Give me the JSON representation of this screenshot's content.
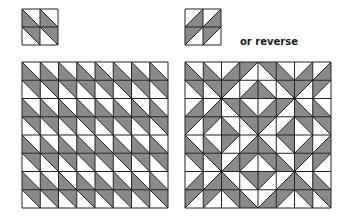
{
  "colors": {
    "gray": "#8a8a8a",
    "white": "#ffffff",
    "line": "#222222"
  },
  "caption": "or reverse",
  "blocks": [
    {
      "name": "block-a",
      "x": 21,
      "y": 8,
      "size": 36,
      "cells": [
        [
          "LL",
          "LL"
        ],
        [
          "UR",
          "UR"
        ]
      ]
    },
    {
      "name": "block-b",
      "x": 184,
      "y": 8,
      "size": 36,
      "cells": [
        [
          "LR",
          "LR"
        ],
        [
          "UL",
          "UL"
        ]
      ]
    }
  ],
  "grids": [
    {
      "name": "quilt-grid-repeat",
      "x": 21,
      "y": 61,
      "size": 146,
      "quadrant": [
        [
          "LL",
          "LL",
          "LL",
          "LL"
        ],
        [
          "UR",
          "UR",
          "UR",
          "UR"
        ],
        [
          "LL",
          "LL",
          "LL",
          "LL"
        ],
        [
          "UR",
          "UR",
          "UR",
          "UR"
        ]
      ],
      "mirror": false
    },
    {
      "name": "quilt-grid-mirrored",
      "x": 184,
      "y": 61,
      "size": 146,
      "quadrant": [
        [
          "LL",
          "LL",
          "LR",
          "UL"
        ],
        [
          "UR",
          "UR",
          "UL",
          "LR"
        ],
        [
          "LR",
          "LR",
          "UR",
          "LL"
        ],
        [
          "UL",
          "UL",
          "LL",
          "UR"
        ]
      ],
      "mirror": true
    }
  ]
}
